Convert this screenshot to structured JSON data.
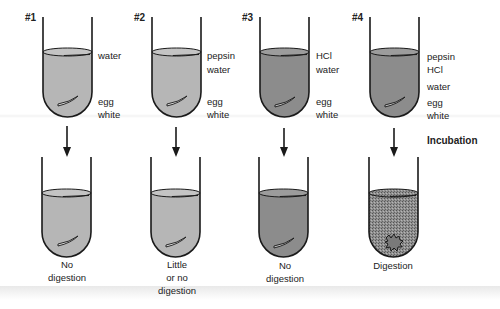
{
  "colors": {
    "light_fluid": "#b6b6b6",
    "dark_fluid": "#8c8c8c",
    "outline": "#1a1a1a",
    "background": "#ffffff"
  },
  "step_label": "Incubation",
  "tubes": [
    {
      "number": "#1",
      "contents": [
        "water",
        "",
        "egg",
        "white"
      ],
      "result": [
        "No",
        "digestion"
      ],
      "fluid": "light",
      "digested": false
    },
    {
      "number": "#2",
      "contents": [
        "pepsin",
        "water",
        "egg",
        "white"
      ],
      "result": [
        "Little",
        "or no",
        "digestion"
      ],
      "fluid": "light",
      "digested": false
    },
    {
      "number": "#3",
      "contents": [
        "HCl",
        "water",
        "egg",
        "white"
      ],
      "result": [
        "No",
        "digestion"
      ],
      "fluid": "dark",
      "digested": false
    },
    {
      "number": "#4",
      "contents": [
        "pepsin",
        "HCl",
        "water",
        "egg",
        "white"
      ],
      "result": [
        "Digestion"
      ],
      "fluid": "dark",
      "digested": true
    }
  ]
}
